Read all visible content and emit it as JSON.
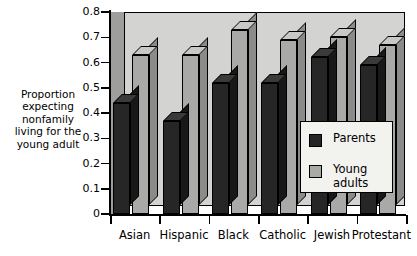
{
  "chart_data": {
    "type": "bar",
    "title": "",
    "xlabel": "",
    "ylabel": "Proportion\nexpecting\nnonfamily\nliving for the\nyoung adult",
    "categories": [
      "Asian",
      "Hispanic",
      "Black",
      "Catholic",
      "Jewish",
      "Protestant"
    ],
    "series": [
      {
        "name": "Parents",
        "values": [
          0.44,
          0.37,
          0.52,
          0.52,
          0.62,
          0.59
        ],
        "color": "#262626"
      },
      {
        "name": "Young adults",
        "values": [
          0.63,
          0.63,
          0.73,
          0.69,
          0.7,
          0.67
        ],
        "color": "#a9a9a7"
      }
    ],
    "ylim": [
      0,
      0.8
    ],
    "yticks": [
      "0",
      "0.1",
      "0.2",
      "0.3",
      "0.4",
      "0.5",
      "0.6",
      "0.7",
      "0.8"
    ],
    "grid": false,
    "legend_position": "inside-right",
    "style": "3d-bars-grey-backwall"
  },
  "legend": {
    "items": [
      {
        "label": "Parents",
        "swatch": "#262626"
      },
      {
        "label": "Young\nadults",
        "swatch": "#a9a9a7"
      }
    ]
  },
  "colors": {
    "backwall": "#d3d3d1",
    "leftwall": "#9e9e9c",
    "axis": "#000000",
    "legend_bg": "#f2f2ef"
  }
}
